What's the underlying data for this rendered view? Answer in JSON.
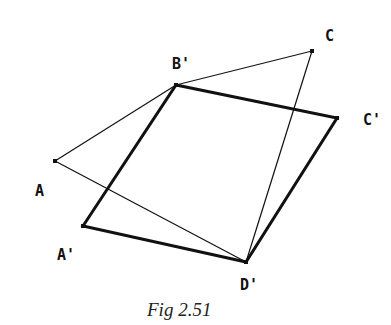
{
  "figure": {
    "caption": "Fig 2.51",
    "colors": {
      "line": "#111111",
      "background": "#ffffff"
    },
    "points": {
      "A": {
        "label": "A",
        "x": 55,
        "y": 161
      },
      "B'": {
        "label": "B'",
        "x": 176,
        "y": 85
      },
      "C": {
        "label": "C",
        "x": 312,
        "y": 51
      },
      "C'": {
        "label": "C'",
        "x": 337,
        "y": 118
      },
      "A'": {
        "label": "A'",
        "x": 83,
        "y": 226
      },
      "D'": {
        "label": "D'",
        "x": 246,
        "y": 262
      }
    },
    "labels": [
      {
        "id": "B'",
        "text": "B'",
        "x": 172,
        "y": 69
      },
      {
        "id": "C",
        "text": "C",
        "x": 325,
        "y": 41
      },
      {
        "id": "C'",
        "text": "C'",
        "x": 363,
        "y": 125
      },
      {
        "id": "A",
        "text": "A",
        "x": 35,
        "y": 196
      },
      {
        "id": "A'",
        "text": "A'",
        "x": 57,
        "y": 260
      },
      {
        "id": "D'",
        "text": "D'",
        "x": 240,
        "y": 290
      }
    ],
    "original_quadrilateral": {
      "description": "Thin-line quadrilateral A-B'-C-D'",
      "vertices": [
        "A",
        "B'",
        "C",
        "D'"
      ],
      "stroke_width": 1.2
    },
    "image_parallelogram": {
      "description": "Thick-line parallelogram A'-B'-C'-D'",
      "vertices": [
        "A'",
        "B'",
        "C'",
        "D'"
      ],
      "stroke_width": 3
    }
  }
}
